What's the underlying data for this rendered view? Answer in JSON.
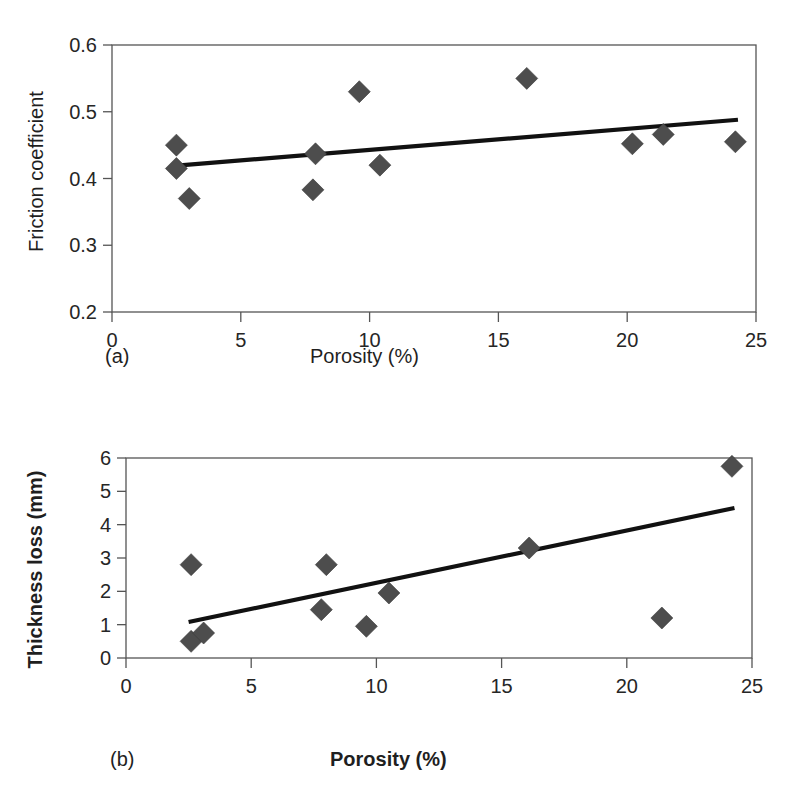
{
  "figure": {
    "background_color": "#ffffff",
    "marker_color": "#4d4d4d",
    "trendline_color": "#111111",
    "axis_color": "#555555"
  },
  "panels": [
    {
      "id": "a",
      "panel_label": "(a)",
      "xlabel": "Porosity (%)",
      "ylabel": "Friction coefficient",
      "xlabel_bold": false,
      "ylabel_bold": false,
      "x_ticks": [
        "0",
        "5",
        "10",
        "15",
        "20",
        "25"
      ],
      "y_ticks": [
        "0.2",
        "0.3",
        "0.4",
        "0.5",
        "0.6"
      ]
    },
    {
      "id": "b",
      "panel_label": "(b)",
      "xlabel": "Porosity (%)",
      "ylabel": "Thickness loss (mm)",
      "xlabel_bold": true,
      "ylabel_bold": true,
      "x_ticks": [
        "0",
        "5",
        "10",
        "15",
        "20",
        "25"
      ],
      "y_ticks": [
        "0",
        "1",
        "2",
        "3",
        "4",
        "5",
        "6"
      ]
    }
  ],
  "chart_data": [
    {
      "type": "scatter",
      "panel": "(a)",
      "title": "",
      "xlabel": "Porosity (%)",
      "ylabel": "Friction coefficient",
      "xlim": [
        0,
        25
      ],
      "ylim": [
        0.2,
        0.6
      ],
      "xticks": [
        0,
        5,
        10,
        15,
        20,
        25
      ],
      "yticks": [
        0.2,
        0.3,
        0.4,
        0.5,
        0.6
      ],
      "grid": false,
      "legend": null,
      "marker": "diamond",
      "points": [
        {
          "x": 2.5,
          "y": 0.45
        },
        {
          "x": 2.5,
          "y": 0.415
        },
        {
          "x": 3.0,
          "y": 0.37
        },
        {
          "x": 7.8,
          "y": 0.383
        },
        {
          "x": 7.9,
          "y": 0.437
        },
        {
          "x": 9.6,
          "y": 0.53
        },
        {
          "x": 10.4,
          "y": 0.42
        },
        {
          "x": 16.1,
          "y": 0.55
        },
        {
          "x": 20.2,
          "y": 0.452
        },
        {
          "x": 21.4,
          "y": 0.466
        },
        {
          "x": 24.2,
          "y": 0.455
        }
      ],
      "trendline": {
        "x0": 2.4,
        "y0": 0.419,
        "x1": 24.3,
        "y1": 0.488
      }
    },
    {
      "type": "scatter",
      "panel": "(b)",
      "title": "",
      "xlabel": "Porosity (%)",
      "ylabel": "Thickness loss (mm)",
      "xlim": [
        0,
        25
      ],
      "ylim": [
        0,
        6
      ],
      "xticks": [
        0,
        5,
        10,
        15,
        20,
        25
      ],
      "yticks": [
        0,
        1,
        2,
        3,
        4,
        5,
        6
      ],
      "grid": false,
      "legend": null,
      "marker": "diamond",
      "points": [
        {
          "x": 2.6,
          "y": 2.8
        },
        {
          "x": 2.6,
          "y": 0.5
        },
        {
          "x": 3.1,
          "y": 0.75
        },
        {
          "x": 7.8,
          "y": 1.45
        },
        {
          "x": 8.0,
          "y": 2.8
        },
        {
          "x": 9.6,
          "y": 0.95
        },
        {
          "x": 10.5,
          "y": 1.95
        },
        {
          "x": 16.1,
          "y": 3.3
        },
        {
          "x": 21.4,
          "y": 1.2
        },
        {
          "x": 24.2,
          "y": 5.75
        }
      ],
      "trendline": {
        "x0": 2.5,
        "y0": 1.08,
        "x1": 24.3,
        "y1": 4.5
      }
    }
  ]
}
